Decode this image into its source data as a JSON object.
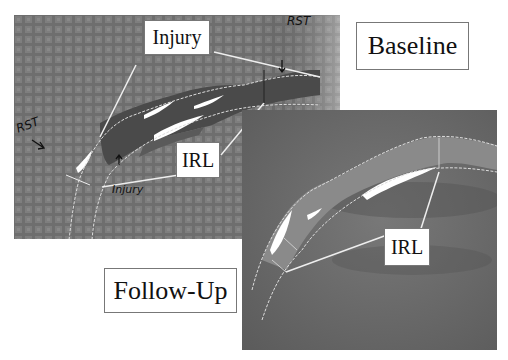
{
  "figure": {
    "panels": [
      {
        "name": "Baseline",
        "label": "Baseline"
      },
      {
        "name": "Follow-Up",
        "label": "Follow-Up"
      }
    ],
    "annotations": {
      "injury": "Injury",
      "irl_baseline": "IRL",
      "irl_followup": "IRL"
    },
    "handwritten": {
      "rst_top": "RST",
      "rst_left": "RST",
      "injury_scrawl": "Injury"
    }
  }
}
